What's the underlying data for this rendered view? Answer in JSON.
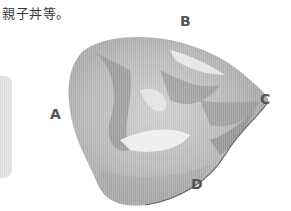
{
  "document": {
    "text_fragment": "親子丼等。"
  },
  "figure": {
    "labels": {
      "a": "A",
      "b": "B",
      "c": "C",
      "d": "D"
    },
    "colors": {
      "dark": "#8a8a8a",
      "mid": "#a9a9a9",
      "light": "#cfcfcf",
      "highlight": "#f2f2f2",
      "label": "#555555",
      "side_tab": "#e0e0e0"
    }
  }
}
